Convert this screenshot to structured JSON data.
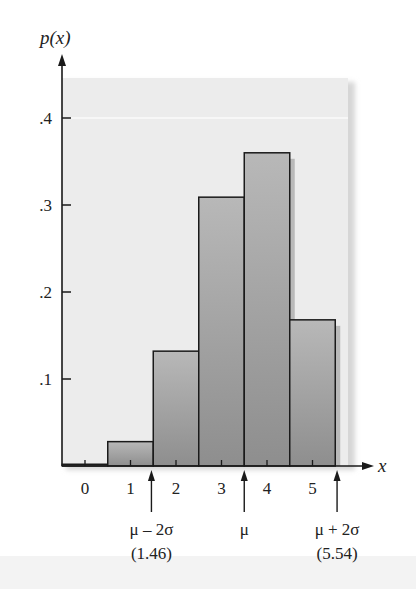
{
  "chart_data": {
    "type": "bar",
    "title": "",
    "xlabel": "x",
    "ylabel": "p(x)",
    "categories": [
      "0",
      "1",
      "2",
      "3",
      "4",
      "5"
    ],
    "x": [
      0,
      1,
      2,
      3,
      4,
      5
    ],
    "values": [
      0.002,
      0.028,
      0.132,
      0.309,
      0.36,
      0.168
    ],
    "xlim": [
      -0.5,
      5.8
    ],
    "ylim": [
      0,
      0.45
    ],
    "yticks": [
      0.1,
      0.2,
      0.3,
      0.4
    ],
    "ytick_labels": [
      ".1",
      ".2",
      ".3",
      ".4"
    ],
    "xticks": [
      0,
      1,
      2,
      3,
      4,
      5
    ],
    "xtick_labels": [
      "0",
      "1",
      "2",
      "3",
      "4",
      "5"
    ],
    "grid": false,
    "legend": "none",
    "annotations": [
      {
        "x": 1.46,
        "label": "μ – 2σ",
        "sublabel": "(1.46)"
      },
      {
        "x": 3.5,
        "label": "μ",
        "sublabel": ""
      },
      {
        "x": 5.54,
        "label": "μ + 2σ",
        "sublabel": "(5.54)"
      }
    ],
    "colors": {
      "bar_top": "#b8b8b8",
      "bar_bottom": "#8e8e8e",
      "bar_edge": "#1a1a1a",
      "panel": "#ececec",
      "axis": "#1a1a1a"
    }
  }
}
